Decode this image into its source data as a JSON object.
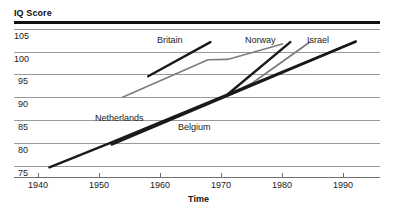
{
  "chart_data": {
    "type": "line",
    "title": "",
    "xlabel": "Time",
    "ylabel": "IQ Score",
    "xlim": [
      1936,
      1996
    ],
    "ylim": [
      72.5,
      106.5
    ],
    "grid": true,
    "legend_position": "inline-labels",
    "x_ticks": [
      1940,
      1950,
      1960,
      1970,
      1980,
      1990
    ],
    "x_tick_labels": [
      "1940",
      "1950",
      "1960",
      "1970",
      "1980",
      "1990"
    ],
    "y_ticks": [
      75,
      80,
      85,
      90,
      95,
      100,
      105
    ],
    "y_tick_labels": [
      "75",
      "80",
      "85",
      "90",
      "95",
      "100",
      "105"
    ],
    "series": [
      {
        "name": "Britain",
        "color": "#1a1a1a",
        "width": 2.4,
        "points": [
          [
            1958.0,
            94.6
          ],
          [
            1968.2,
            102.1
          ]
        ]
      },
      {
        "name": "Netherlands",
        "color": "#7d7d7d",
        "width": 1.6,
        "points": [
          [
            1953.8,
            90.0
          ],
          [
            1967.8,
            98.2
          ],
          [
            1971.0,
            98.3
          ],
          [
            1980.0,
            101.7
          ]
        ]
      },
      {
        "name": "Norway",
        "color": "#1a1a1a",
        "width": 2.4,
        "points": [
          [
            1971.0,
            90.6
          ],
          [
            1981.3,
            102.1
          ]
        ]
      },
      {
        "name": "Israel",
        "color": "#7d7d7d",
        "width": 1.8,
        "points": [
          [
            1970.8,
            90.2
          ],
          [
            1975.2,
            93.2
          ],
          [
            1984.5,
            102.1
          ]
        ]
      },
      {
        "name": "Netherlands-long",
        "color": "#1a1a1a",
        "width": 2.4,
        "points": [
          [
            1941.8,
            74.6
          ],
          [
            1952.0,
            80.1
          ],
          [
            1992.0,
            102.2
          ]
        ]
      },
      {
        "name": "Belgium",
        "color": "#1a1a1a",
        "width": 2.4,
        "points": [
          [
            1952.0,
            79.6
          ],
          [
            1992.0,
            102.2
          ]
        ]
      }
    ],
    "annotations": [
      {
        "name": "Britain",
        "text": "Britain",
        "x": 157,
        "y": 35
      },
      {
        "name": "Norway",
        "text": "Norway",
        "x": 245,
        "y": 35
      },
      {
        "name": "Israel",
        "text": "Israel",
        "x": 307,
        "y": 35
      },
      {
        "name": "Netherlands",
        "text": "Netherlands",
        "x": 95,
        "y": 113
      },
      {
        "name": "Belgium",
        "text": "Belgium",
        "x": 178,
        "y": 122
      }
    ]
  },
  "axes": {
    "y_title": "IQ Score",
    "x_title": "Time"
  },
  "colors": {
    "line_dark": "#1a1a1a",
    "line_gray": "#7d7d7d",
    "grid": "#9a9a9a",
    "axis": "#6f6f6f",
    "rule": "#111111",
    "background": "#ffffff"
  }
}
